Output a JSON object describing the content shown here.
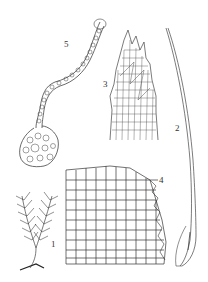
{
  "plate": {
    "figures": [
      {
        "number": "1",
        "subject": "plant-habit",
        "label_pos": {
          "x": 51,
          "y": 246
        }
      },
      {
        "number": "2",
        "subject": "leaf",
        "label_pos": {
          "x": 175,
          "y": 128
        }
      },
      {
        "number": "3",
        "subject": "leaf-apex-cells",
        "label_pos": {
          "x": 103,
          "y": 84
        }
      },
      {
        "number": "4",
        "subject": "leaf-base-cells",
        "label_pos": {
          "x": 159,
          "y": 180
        }
      },
      {
        "number": "5",
        "subject": "gemma-filament",
        "label_pos": {
          "x": 64,
          "y": 43
        }
      }
    ],
    "colors": {
      "ink": "#333333",
      "paper": "#ffffff"
    }
  }
}
